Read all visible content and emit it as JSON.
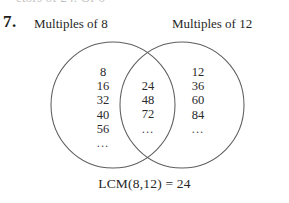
{
  "figure": {
    "problem_number": "7.",
    "top_cut_text": "ctors of 24. Of 6",
    "caption": "LCM(8,12) = 24",
    "stroke_color": "#5e5e5e",
    "text_color": "#2a2a2a",
    "background_color": "#ffffff"
  },
  "labels": {
    "left_set": "Multiples of 8",
    "right_set": "Multiples of 12"
  },
  "sets": {
    "left_only": {
      "name": "multiples-of-8-only",
      "values": [
        "8",
        "16",
        "32",
        "40",
        "56"
      ],
      "ellipsis": "..."
    },
    "intersection": {
      "name": "common-multiples",
      "values": [
        "24",
        "48",
        "72"
      ],
      "ellipsis": "..."
    },
    "right_only": {
      "name": "multiples-of-12-only",
      "values": [
        "12",
        "36",
        "60",
        "84"
      ],
      "ellipsis": "..."
    }
  }
}
